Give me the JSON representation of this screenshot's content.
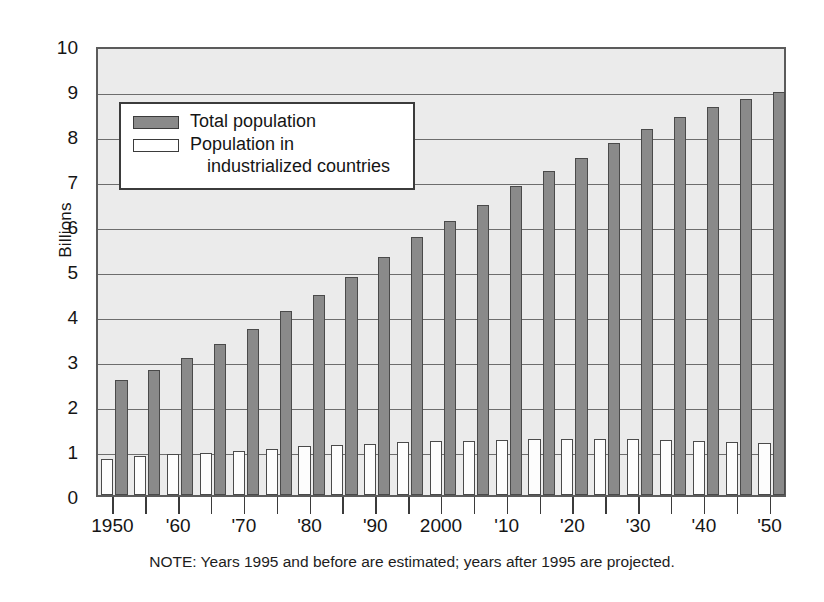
{
  "chart_data": {
    "type": "bar",
    "title": "",
    "subtitle": "",
    "xlabel": "",
    "ylabel": "Billions",
    "ylim": [
      0,
      10
    ],
    "yticks": [
      0,
      1,
      2,
      3,
      4,
      5,
      6,
      7,
      8,
      9,
      10
    ],
    "ytick_labels": [
      "0",
      "1",
      "2",
      "3",
      "4",
      "5",
      "6",
      "7",
      "8",
      "9",
      "10"
    ],
    "grid": true,
    "grid_axis": "y",
    "legend_position": "upper-left-inside",
    "categories": [
      1950,
      1955,
      1960,
      1965,
      1970,
      1975,
      1980,
      1985,
      1990,
      1995,
      2000,
      2005,
      2010,
      2015,
      2020,
      2025,
      2030,
      2035,
      2040,
      2045,
      2050
    ],
    "xtick_labels": [
      "1950",
      "",
      "'60",
      "",
      "'70",
      "",
      "'80",
      "",
      "'90",
      "",
      "2000",
      "",
      "'10",
      "",
      "'20",
      "",
      "'30",
      "",
      "'40",
      "",
      "'50"
    ],
    "series": [
      {
        "name": "Population in industrialized countries",
        "color": "#ffffff",
        "edge_color": "#4a4a4a",
        "values": [
          0.81,
          0.86,
          0.91,
          0.94,
          0.97,
          1.03,
          1.08,
          1.11,
          1.14,
          1.17,
          1.19,
          1.21,
          1.23,
          1.24,
          1.25,
          1.25,
          1.24,
          1.22,
          1.2,
          1.17,
          1.15
        ]
      },
      {
        "name": "Total population",
        "color": "#8a8a8a",
        "edge_color": "#4a4a4a",
        "values": [
          2.56,
          2.78,
          3.04,
          3.35,
          3.7,
          4.09,
          4.45,
          4.85,
          5.29,
          5.73,
          6.09,
          6.44,
          6.86,
          7.2,
          7.5,
          7.82,
          8.13,
          8.4,
          8.62,
          8.8,
          8.95
        ]
      }
    ],
    "note": "NOTE: Years 1995 and before are estimated; years after 1995 are projected."
  },
  "legend": {
    "items": [
      {
        "label": "Total population",
        "label_cont": "",
        "swatch": "total"
      },
      {
        "label": "Population in",
        "label_cont": "industrialized countries",
        "swatch": "industrialized"
      }
    ]
  },
  "colors": {
    "plot_background": "#ebebeb",
    "axis": "#5b5b5b",
    "gridline": "#6d6d6d",
    "total_bar": "#8a8a8a",
    "industrialized_bar": "#ffffff",
    "bar_edge": "#4a4a4a",
    "text": "#151515"
  }
}
